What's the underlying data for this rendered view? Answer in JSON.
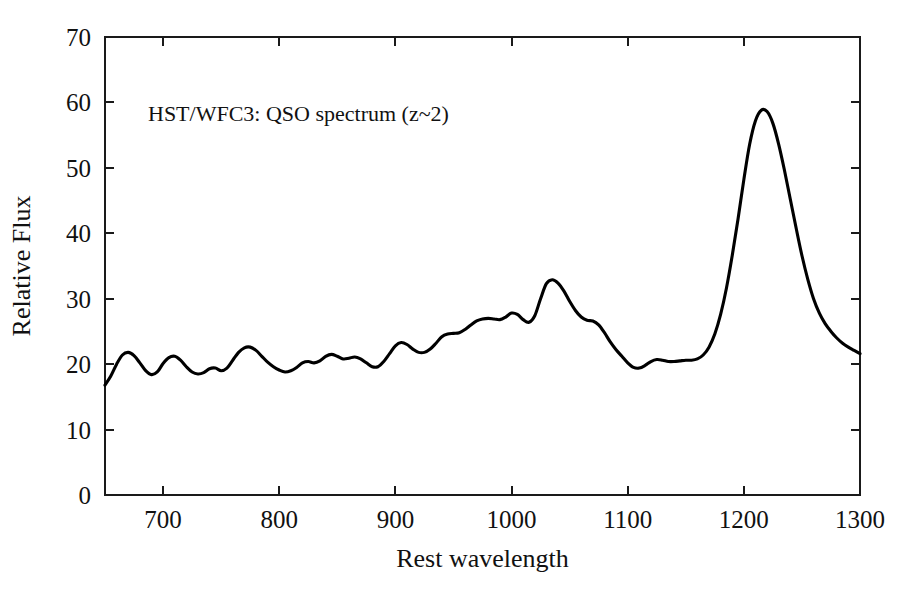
{
  "chart_data": {
    "type": "line",
    "title": "",
    "annotation": "HST/WFC3: QSO spectrum (z~2)",
    "xlabel": "Rest wavelength",
    "ylabel": "Relative Flux",
    "xlim": [
      650,
      1300
    ],
    "ylim": [
      0,
      70
    ],
    "xticks": [
      700,
      800,
      900,
      1000,
      1100,
      1200,
      1300
    ],
    "yticks": [
      0,
      10,
      20,
      30,
      40,
      50,
      60,
      70
    ],
    "grid": false,
    "legend": null,
    "line_color": "#000000",
    "background_color": "#ffffff",
    "series": [
      {
        "name": "QSO flux",
        "x": [
          650,
          655,
          660,
          665,
          670,
          675,
          680,
          685,
          690,
          695,
          700,
          705,
          710,
          715,
          720,
          725,
          730,
          735,
          740,
          745,
          750,
          755,
          760,
          765,
          770,
          775,
          780,
          785,
          790,
          795,
          800,
          805,
          810,
          815,
          820,
          825,
          830,
          835,
          840,
          845,
          850,
          855,
          860,
          865,
          870,
          875,
          880,
          885,
          890,
          895,
          900,
          905,
          910,
          915,
          920,
          925,
          930,
          935,
          940,
          945,
          950,
          955,
          960,
          965,
          970,
          975,
          980,
          985,
          990,
          995,
          1000,
          1005,
          1010,
          1015,
          1020,
          1025,
          1030,
          1035,
          1040,
          1045,
          1050,
          1055,
          1060,
          1065,
          1070,
          1075,
          1080,
          1085,
          1090,
          1095,
          1100,
          1105,
          1110,
          1115,
          1120,
          1125,
          1130,
          1135,
          1140,
          1145,
          1150,
          1155,
          1160,
          1165,
          1170,
          1175,
          1180,
          1185,
          1190,
          1195,
          1200,
          1205,
          1210,
          1215,
          1220,
          1225,
          1230,
          1235,
          1240,
          1245,
          1250,
          1255,
          1260,
          1265,
          1270,
          1275,
          1280,
          1285,
          1290,
          1295,
          1300
        ],
        "y": [
          16.8,
          18.2,
          20.0,
          21.4,
          21.8,
          21.3,
          20.2,
          19.0,
          18.4,
          18.8,
          20.1,
          21.0,
          21.2,
          20.6,
          19.6,
          18.8,
          18.5,
          18.7,
          19.3,
          19.4,
          19.0,
          19.4,
          20.6,
          21.8,
          22.5,
          22.6,
          22.1,
          21.2,
          20.3,
          19.6,
          19.1,
          18.8,
          19.0,
          19.5,
          20.2,
          20.4,
          20.2,
          20.5,
          21.2,
          21.5,
          21.2,
          20.8,
          20.9,
          21.1,
          20.8,
          20.2,
          19.6,
          19.6,
          20.4,
          21.6,
          22.8,
          23.3,
          23.0,
          22.3,
          21.8,
          21.8,
          22.3,
          23.2,
          24.2,
          24.6,
          24.7,
          24.8,
          25.3,
          26.0,
          26.6,
          26.9,
          27.0,
          26.9,
          26.8,
          27.2,
          27.8,
          27.6,
          26.8,
          26.4,
          27.4,
          30.0,
          32.3,
          32.9,
          32.4,
          31.2,
          29.6,
          28.2,
          27.2,
          26.7,
          26.6,
          26.0,
          24.8,
          23.4,
          22.2,
          21.2,
          20.2,
          19.5,
          19.4,
          19.8,
          20.4,
          20.7,
          20.6,
          20.4,
          20.4,
          20.5,
          20.6,
          20.6,
          20.8,
          21.4,
          22.6,
          24.6,
          27.6,
          31.6,
          36.6,
          42.2,
          48.2,
          53.6,
          57.2,
          58.8,
          58.6,
          56.8,
          53.6,
          49.6,
          45.2,
          40.8,
          36.6,
          33.0,
          30.0,
          27.8,
          26.2,
          25.0,
          24.0,
          23.2,
          22.6,
          22.1,
          21.6
        ],
        "peaks": [
          {
            "label": "Lyman-alpha",
            "x": 1215,
            "y": 58.8
          },
          {
            "label": "OVI / Lyman-beta",
            "x": 1030,
            "y": 32.9
          }
        ]
      }
    ]
  },
  "layout": {
    "plot_left": 105,
    "plot_right": 860,
    "plot_top": 37,
    "plot_bottom": 495,
    "annotation_x": 148,
    "annotation_y": 121
  }
}
